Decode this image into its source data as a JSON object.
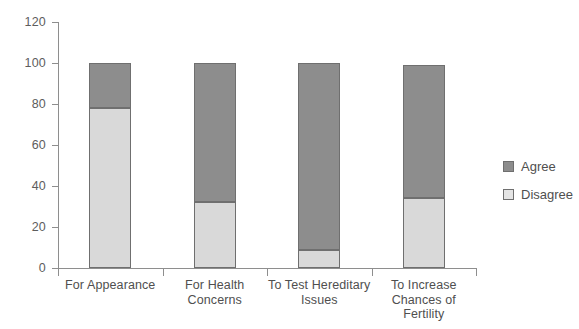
{
  "chart_data": {
    "type": "bar",
    "subtype": "stacked-bar-100",
    "title": "",
    "xlabel": "",
    "ylabel": "",
    "ylim": [
      0,
      120
    ],
    "grid": false,
    "legend_position": "right",
    "categories": [
      "For Appearance",
      "For Health Concerns",
      "To Test Hereditary Issues",
      "To Increase Chances of Fertility"
    ],
    "category_lines": [
      [
        "For Appearance"
      ],
      [
        "For Health",
        "Concerns"
      ],
      [
        "To Test Hereditary",
        "Issues"
      ],
      [
        "To Increase",
        "Chances of",
        "Fertility"
      ]
    ],
    "y_ticks": [
      0,
      20,
      40,
      60,
      80,
      100,
      120
    ],
    "series": [
      {
        "name": "Disagree",
        "color": "#d9d9d9",
        "values": [
          78,
          32,
          9,
          34
        ]
      },
      {
        "name": "Agree",
        "color": "#8d8d8d",
        "values": [
          22,
          68,
          91,
          65
        ]
      }
    ],
    "totals": [
      100,
      100,
      100,
      99
    ],
    "legend": [
      "Agree",
      "Disagree"
    ]
  },
  "legend": {
    "items": [
      {
        "label": "Agree",
        "swatch": "agree"
      },
      {
        "label": "Disagree",
        "swatch": "disagree"
      }
    ]
  },
  "axis": {
    "y_labels": [
      "120",
      "100",
      "80",
      "60",
      "40",
      "20",
      "0"
    ]
  },
  "colors": {
    "agree": "#8d8d8d",
    "disagree": "#d9d9d9",
    "axis": "#8e8e8e",
    "text": "#4f4f4f",
    "background": "#ffffff"
  }
}
